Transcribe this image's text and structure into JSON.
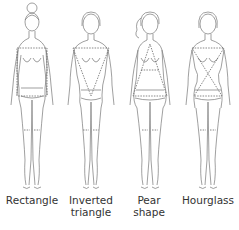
{
  "figures": [
    {
      "label_line1": "Rectangle",
      "label_line2": "",
      "hair": "bun"
    },
    {
      "label_line1": "Inverted",
      "label_line2": "triangle",
      "hair": "bob"
    },
    {
      "label_line1": "Pear",
      "label_line2": "shape",
      "hair": "ponytail"
    },
    {
      "label_line1": "Hourglass",
      "label_line2": "",
      "hair": "short"
    }
  ],
  "colors": {
    "line": "#777777",
    "guide": "#555555",
    "text": "#333333",
    "background": "#ffffff"
  }
}
